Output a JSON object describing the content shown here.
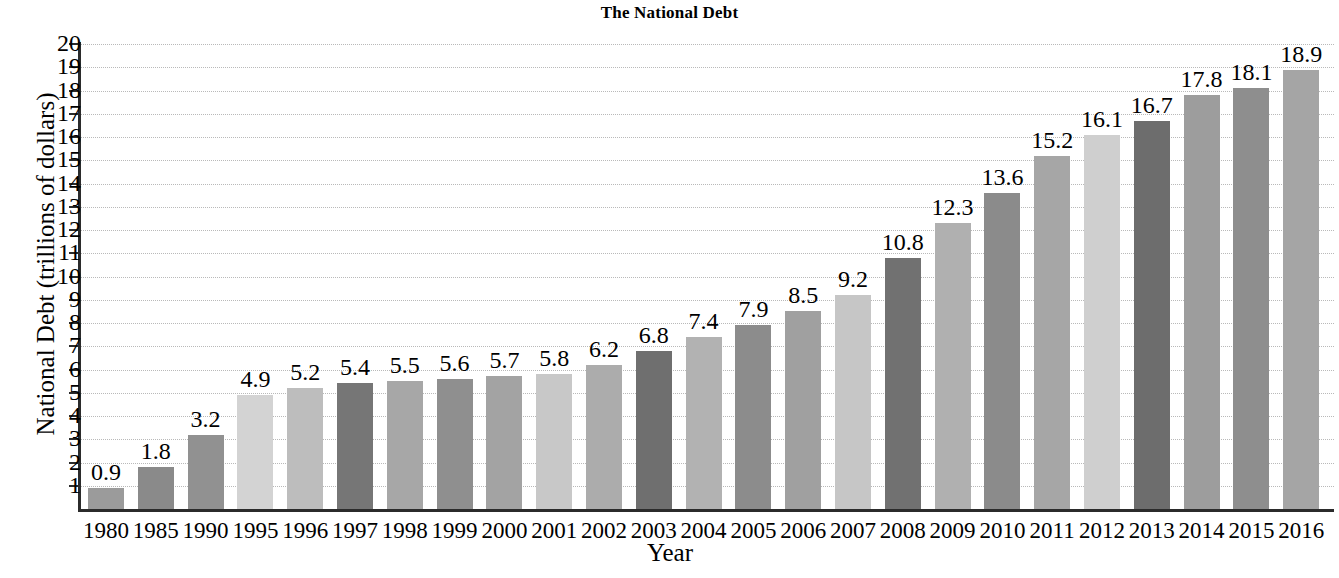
{
  "chart_data": {
    "type": "bar",
    "title": "The National Debt",
    "xlabel": "Year",
    "ylabel": "National Debt (trillions of dollars)",
    "categories": [
      "1980",
      "1985",
      "1990",
      "1995",
      "1996",
      "1997",
      "1998",
      "1999",
      "2000",
      "2001",
      "2002",
      "2003",
      "2004",
      "2005",
      "2006",
      "2007",
      "2008",
      "2009",
      "2010",
      "2011",
      "2012",
      "2013",
      "2014",
      "2015",
      "2016"
    ],
    "values": [
      0.9,
      1.8,
      3.2,
      4.9,
      5.2,
      5.4,
      5.5,
      5.6,
      5.7,
      5.8,
      6.2,
      6.8,
      7.4,
      7.9,
      8.5,
      9.2,
      10.8,
      12.3,
      13.6,
      15.2,
      16.1,
      16.7,
      17.8,
      18.1,
      18.9
    ],
    "value_labels": [
      "0.9",
      "1.8",
      "3.2",
      "4.9",
      "5.2",
      "5.4",
      "5.5",
      "5.6",
      "5.7",
      "5.8",
      "6.2",
      "6.8",
      "7.4",
      "7.9",
      "8.5",
      "9.2",
      "10.8",
      "12.3",
      "13.6",
      "15.2",
      "16.1",
      "16.7",
      "17.8",
      "18.1",
      "18.9"
    ],
    "bar_colors": [
      "#9b9b9b",
      "#8a8a8a",
      "#919191",
      "#d3d3d3",
      "#bdbdbd",
      "#767676",
      "#a7a7a7",
      "#8f8f8f",
      "#a3a3a3",
      "#c8c8c8",
      "#acacac",
      "#6f6f6f",
      "#b2b2b2",
      "#8c8c8c",
      "#a0a0a0",
      "#c6c6c6",
      "#717171",
      "#b0b0b0",
      "#8b8b8b",
      "#a6a6a6",
      "#cfcfcf",
      "#6d6d6d",
      "#9d9d9d",
      "#8e8e8e",
      "#a5a5a5"
    ],
    "ytick_labels": [
      "20",
      "19",
      "18",
      "17",
      "16",
      "15",
      "14",
      "13",
      "12",
      "11",
      "10",
      "9",
      "8",
      "7",
      "6",
      "5",
      "4",
      "3",
      "2",
      "1"
    ],
    "ytick_values": [
      20,
      19,
      18,
      17,
      16,
      15,
      14,
      13,
      12,
      11,
      10,
      9,
      8,
      7,
      6,
      5,
      4,
      3,
      2,
      1
    ],
    "ylim": [
      0,
      20
    ],
    "grid": true,
    "grid_style": "dotted",
    "grid_axis": "y",
    "legend": "none",
    "axis_color": "#2b2b2b",
    "grid_color": "#b9b9b9",
    "background": "#ffffff"
  }
}
